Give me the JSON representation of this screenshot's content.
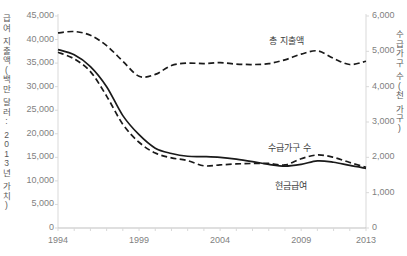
{
  "chart_data": {
    "type": "line",
    "title": "",
    "xlabel": "",
    "ylabel": "급여 지출액(백만 달러: 2013년 가치)",
    "y2label": "수급가구 수(천 가구)",
    "grid": false,
    "legend_position": "inline-annotations",
    "x": [
      1994,
      1995,
      1996,
      1997,
      1998,
      1999,
      2000,
      2001,
      2002,
      2003,
      2004,
      2005,
      2006,
      2007,
      2008,
      2009,
      2010,
      2011,
      2012,
      2013
    ],
    "xlim": [
      1994,
      2013
    ],
    "xticks": [
      1994,
      1999,
      2004,
      2009,
      2013
    ],
    "xtick_labels": [
      "1994",
      "1999",
      "2004",
      "2009",
      "2013"
    ],
    "ylim": [
      0,
      45000
    ],
    "yticks": [
      0,
      5000,
      10000,
      15000,
      20000,
      25000,
      30000,
      35000,
      40000,
      45000
    ],
    "ytick_labels": [
      "0",
      "5,000",
      "10,000",
      "15,000",
      "20,000",
      "25,000",
      "30,000",
      "35,000",
      "40,000",
      "45,000"
    ],
    "y2lim": [
      0,
      6000
    ],
    "y2ticks": [
      0,
      1000,
      2000,
      3000,
      4000,
      5000,
      6000
    ],
    "y2tick_labels": [
      "0",
      "1,000",
      "2,000",
      "3,000",
      "4,000",
      "5,000",
      "6,000"
    ],
    "series": [
      {
        "name": "총 지출액",
        "axis": "left",
        "style": "dashed",
        "color": "#1a1a1a",
        "label_x": 2008.1,
        "label_y": 39800,
        "values": [
          41400,
          41700,
          40900,
          38700,
          35400,
          32200,
          32600,
          34500,
          35000,
          34900,
          35100,
          34800,
          34700,
          34900,
          35700,
          36900,
          37600,
          36000,
          34700,
          35400
        ]
      },
      {
        "name": "수급가구 수",
        "axis": "right",
        "style": "solid",
        "color": "#1a1a1a",
        "label_x": 2008.3,
        "label_y": 2280,
        "values": [
          5050,
          4900,
          4570,
          4000,
          3180,
          2640,
          2260,
          2110,
          2030,
          2020,
          2000,
          1950,
          1880,
          1800,
          1750,
          1800,
          1900,
          1860,
          1770,
          1690
        ]
      },
      {
        "name": "현금급여",
        "axis": "left",
        "style": "dashed",
        "color": "#1a1a1a",
        "label_x": 2008.4,
        "label_y": 9200,
        "values": [
          37300,
          35900,
          33200,
          28000,
          22000,
          18200,
          15900,
          14900,
          14300,
          13200,
          13400,
          13600,
          13700,
          13700,
          13400,
          14700,
          15500,
          15000,
          13900,
          12900
        ]
      }
    ]
  }
}
